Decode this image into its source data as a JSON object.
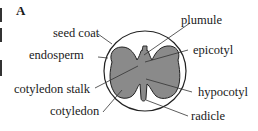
{
  "figure": {
    "panel_letter": "A",
    "colors": {
      "fill_gray": "#8a8a8a",
      "outline": "#222222",
      "background": "#ffffff"
    },
    "labels": {
      "seed_coat": "seed coat",
      "endosperm": "endosperm",
      "cotyledon_stalk": "cotyledon stalk",
      "cotyledon": "cotyledon",
      "plumule": "plumule",
      "epicotyl": "epicotyl",
      "hypocotyl": "hypocotyl",
      "radicle": "radicle"
    }
  }
}
